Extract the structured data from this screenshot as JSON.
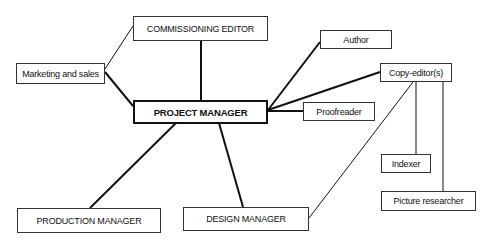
{
  "diagram": {
    "type": "organizational-chart",
    "nodes": [
      {
        "id": "commissioning_editor",
        "label": "COMMISSIONING EDITOR"
      },
      {
        "id": "marketing",
        "label": "Marketing and sales"
      },
      {
        "id": "author",
        "label": "Author"
      },
      {
        "id": "project_manager",
        "label": "PROJECT MANAGER"
      },
      {
        "id": "copy_editor",
        "label": "Copy-editor(s)"
      },
      {
        "id": "proofreader",
        "label": "Proofreader"
      },
      {
        "id": "production_manager",
        "label": "PRODUCTION MANAGER"
      },
      {
        "id": "design_manager",
        "label": "DESIGN MANAGER"
      },
      {
        "id": "indexer",
        "label": "Indexer"
      },
      {
        "id": "picture_researcher",
        "label": "Picture researcher"
      }
    ],
    "edges": [
      {
        "from": "project_manager",
        "to": "commissioning_editor",
        "weight": "thick"
      },
      {
        "from": "project_manager",
        "to": "marketing",
        "weight": "thick"
      },
      {
        "from": "project_manager",
        "to": "author",
        "weight": "thick"
      },
      {
        "from": "project_manager",
        "to": "copy_editor",
        "weight": "thick"
      },
      {
        "from": "project_manager",
        "to": "proofreader",
        "weight": "thick"
      },
      {
        "from": "project_manager",
        "to": "production_manager",
        "weight": "thick"
      },
      {
        "from": "project_manager",
        "to": "design_manager",
        "weight": "thick"
      },
      {
        "from": "marketing",
        "to": "commissioning_editor",
        "weight": "thin"
      },
      {
        "from": "copy_editor",
        "to": "design_manager",
        "weight": "thin"
      },
      {
        "from": "copy_editor",
        "to": "indexer",
        "weight": "thin"
      },
      {
        "from": "copy_editor",
        "to": "picture_researcher",
        "weight": "thin"
      }
    ]
  }
}
